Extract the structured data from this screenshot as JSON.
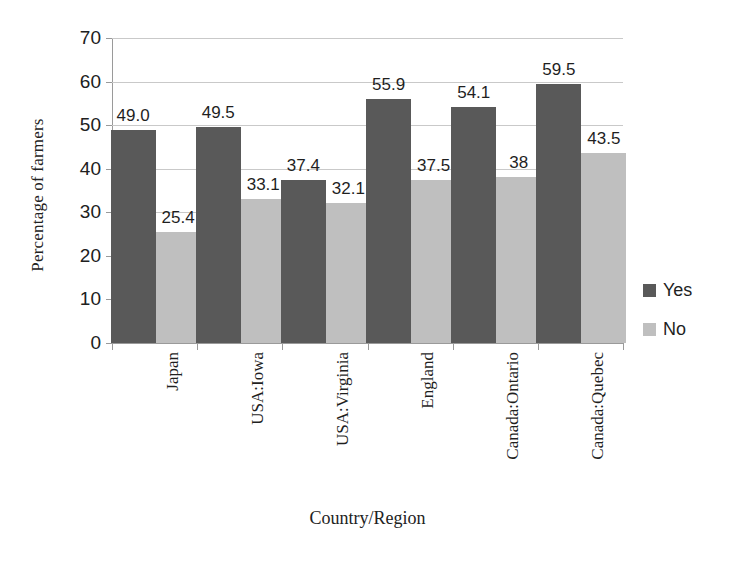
{
  "chart_data": {
    "type": "bar",
    "title": "",
    "xlabel": "Country/Region",
    "ylabel": "Percentage of farmers",
    "categories": [
      "Japan",
      "USA:Iowa",
      "USA:Virginia",
      "England",
      "Canada:Ontario",
      "Canada:Quebec"
    ],
    "series": [
      {
        "name": "Yes",
        "color": "#595959",
        "values": [
          49.0,
          49.5,
          37.4,
          55.9,
          54.1,
          59.5
        ],
        "labels": [
          "49.0",
          "49.5",
          "37.4",
          "55.9",
          "54.1",
          "59.5"
        ]
      },
      {
        "name": "No",
        "color": "#bfbfbf",
        "values": [
          25.4,
          33.1,
          32.1,
          37.5,
          38,
          43.5
        ],
        "labels": [
          "25.4",
          "33.1",
          "32.1",
          "37.5",
          "38",
          "43.5"
        ]
      }
    ],
    "ylim": [
      0,
      70
    ],
    "yticks": [
      0,
      10,
      20,
      30,
      40,
      50,
      60,
      70
    ],
    "ytick_labels": [
      "0",
      "10",
      "20",
      "30",
      "40",
      "50",
      "60",
      "70"
    ],
    "grid": "horizontal",
    "legend_position": "right"
  },
  "legend": {
    "items": [
      {
        "label": "Yes",
        "swatch": "yes"
      },
      {
        "label": "No",
        "swatch": "no"
      }
    ]
  },
  "axes": {
    "x_title": "Country/Region",
    "y_title": "Percentage of farmers"
  }
}
